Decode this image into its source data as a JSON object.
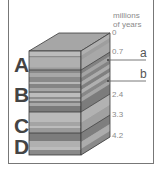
{
  "diagram": {
    "type": "stratigraphic-block",
    "axis": {
      "title_line1": "millions",
      "title_line2": "of years",
      "ticks": [
        {
          "label": "0",
          "y": 33
        },
        {
          "label": "0.7",
          "y": 52
        },
        {
          "label": "2.4",
          "y": 95
        },
        {
          "label": "3.3",
          "y": 115
        },
        {
          "label": "4.2",
          "y": 136
        }
      ]
    },
    "units": [
      {
        "label": "A",
        "top": 51,
        "bottom": 70
      },
      {
        "label": "B",
        "top": 70,
        "bottom": 112
      },
      {
        "label": "C",
        "top": 112,
        "bottom": 133
      },
      {
        "label": "D",
        "top": 133,
        "bottom": 155
      }
    ],
    "markers": [
      {
        "label": "a",
        "line_y": 60
      },
      {
        "label": "b",
        "line_y": 81
      }
    ],
    "colors": {
      "light_band": "#b4b4b4",
      "mid_band": "#9a9a9a",
      "dark_band": "#7e7e7e",
      "top_face": "#a6a6a6",
      "edge": "#3a3a3a",
      "text": "#444444",
      "axis_text": "#8a8a8a"
    }
  }
}
